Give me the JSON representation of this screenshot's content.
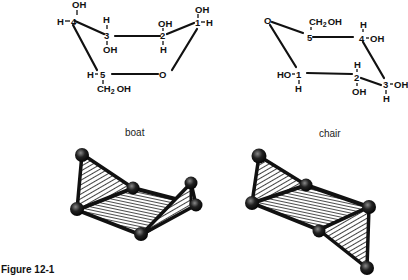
{
  "figure": {
    "caption": "Figure 12-1",
    "panels": [
      {
        "name": "boat",
        "label": "boat",
        "structure": {
          "ring_oxygen": "O",
          "atoms": [
            {
              "num": "1",
              "up": "OH",
              "side": "H",
              "down": ""
            },
            {
              "num": "2",
              "up": "OH",
              "side": "",
              "down": "H"
            },
            {
              "num": "3",
              "up": "H",
              "side": "",
              "down": "OH"
            },
            {
              "num": "4",
              "up": "OH",
              "side": "H",
              "down": ""
            },
            {
              "num": "5",
              "up": "",
              "side": "H",
              "down": "CH2OH"
            }
          ]
        }
      },
      {
        "name": "chair",
        "label": "chair",
        "structure": {
          "ring_oxygen": "O",
          "atoms": [
            {
              "num": "1",
              "up": "",
              "side": "HO",
              "down": "H"
            },
            {
              "num": "2",
              "up": "H",
              "side": "",
              "down": "OH"
            },
            {
              "num": "3",
              "up": "",
              "side": "OH",
              "down": "H"
            },
            {
              "num": "4",
              "up": "H",
              "side": "OH",
              "down": ""
            },
            {
              "num": "5",
              "up": "CH2OH",
              "side": "",
              "down": ""
            }
          ]
        }
      }
    ]
  },
  "text": {
    "boat_label": "boat",
    "chair_label": "chair",
    "caption": "Figure 12-1",
    "O": "O",
    "OH": "OH",
    "H": "H",
    "HO": "HO",
    "n1": "1",
    "n2": "2",
    "n3": "3",
    "n4": "4",
    "n5": "5",
    "CH": "CH",
    "sub2": "2",
    "OH_tail": "OH"
  }
}
